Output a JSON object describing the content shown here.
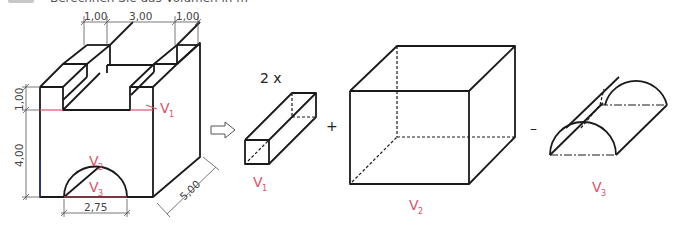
{
  "header": {
    "task_text": "Berechnen Sie das Volumen in m³"
  },
  "dimensions": {
    "top_left_width": "1,00",
    "top_middle_width": "3,00",
    "top_right_width": "1,00",
    "left_upper_height": "1,00",
    "left_lower_height": "4,00",
    "arch_width": "2,75",
    "depth": "5,00"
  },
  "labels": {
    "v1_main": "V",
    "v1_sub": "1",
    "v2_main": "V",
    "v2_sub": "2",
    "v3_main": "V",
    "v3_sub": "3",
    "multiplier": "2 x",
    "plus": "+",
    "minus": "–",
    "arrow": "⇨"
  },
  "colors": {
    "line": "#1a1a1a",
    "accent": "#e0506a",
    "dim": "#444444"
  }
}
